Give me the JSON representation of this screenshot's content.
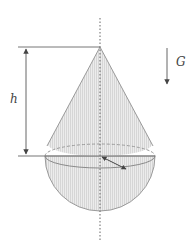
{
  "diagram": {
    "title": "",
    "labels": {
      "height": "h",
      "gravity": "G"
    },
    "colors": {
      "stroke": "#8a8a8a",
      "dark_stroke": "#555555",
      "fill": "#e6e6e6",
      "hatch": "#d2d2d2",
      "arrow": "#444444"
    },
    "geometry": {
      "axis_x": 100,
      "apex_y": 47,
      "equator_y": 156,
      "radius": 55,
      "equator_ry": 12
    }
  }
}
